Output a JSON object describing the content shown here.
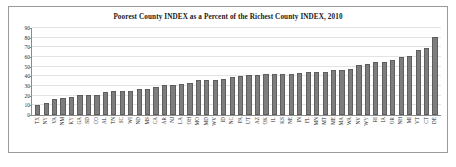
{
  "figure": {
    "border_color": "#9a9a9a",
    "background": "#ffffff"
  },
  "chart_data": {
    "type": "bar",
    "title": "Poorest County INDEX as a Percent of the Richest County INDEX, 2010",
    "xlabel": "",
    "ylabel": "",
    "ylim": [
      0,
      90
    ],
    "yticks": [
      0,
      10,
      20,
      30,
      40,
      50,
      60,
      70,
      80,
      90
    ],
    "grid": true,
    "legend": "none",
    "bar_color": "#7d7d7d",
    "bar_edge_color": "#5e5e5e",
    "categories": [
      "TX",
      "NY",
      "VA",
      "NM",
      "KY",
      "GA",
      "SD",
      "CO",
      "AL",
      "TN",
      "SC",
      "WI",
      "ND",
      "MS",
      "CA",
      "AR",
      "NJ",
      "LA",
      "OH",
      "MO",
      "MD",
      "WV",
      "ID",
      "NC",
      "PA",
      "UT",
      "AZ",
      "OK",
      "IL",
      "KS",
      "NE",
      "IN",
      "FL",
      "MN",
      "MT",
      "ME",
      "MA",
      "WA",
      "NV",
      "WY",
      "RI",
      "IA",
      "OR",
      "NH",
      "MI",
      "VT",
      "CT",
      "DE"
    ],
    "values": [
      10,
      12,
      17,
      18,
      19,
      21,
      21,
      21,
      24,
      25,
      25,
      25,
      27,
      27,
      29,
      31,
      31,
      32,
      33,
      36,
      36,
      36,
      37,
      39,
      40,
      41,
      41,
      42,
      42,
      42,
      42,
      43,
      44,
      44,
      45,
      47,
      47,
      48,
      52,
      53,
      55,
      55,
      57,
      60,
      61,
      67,
      69,
      81
    ]
  }
}
